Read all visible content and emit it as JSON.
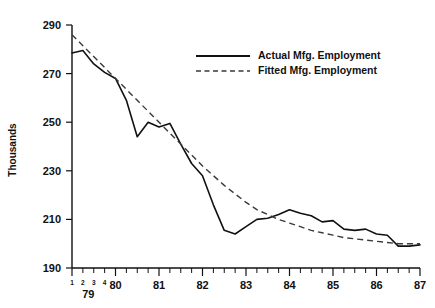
{
  "chart_data": {
    "type": "line",
    "title": "",
    "xlabel": "",
    "ylabel": "Thousands",
    "ylim": [
      190,
      290
    ],
    "ytick_values": [
      190,
      210,
      230,
      250,
      270,
      290
    ],
    "ytick_labels": [
      "190",
      "210",
      "230",
      "250",
      "270",
      "290"
    ],
    "grid": false,
    "legend_position": "top-center-right",
    "x_axis": {
      "year_labels": [
        "79",
        "80",
        "81",
        "82",
        "83",
        "84",
        "85",
        "86",
        "87"
      ],
      "quarter_labels": [
        "1",
        "2",
        "3",
        "4"
      ],
      "quarter_labels_year": "79",
      "tick_interval": "quarterly",
      "range_start": "1979 Q1",
      "range_end": "1987 Q1"
    },
    "x": [
      "79Q1",
      "79Q2",
      "79Q3",
      "79Q4",
      "80Q1",
      "80Q2",
      "80Q3",
      "80Q4",
      "81Q1",
      "81Q2",
      "81Q3",
      "81Q4",
      "82Q1",
      "82Q2",
      "82Q3",
      "82Q4",
      "83Q1",
      "83Q2",
      "83Q3",
      "83Q4",
      "84Q1",
      "84Q2",
      "84Q3",
      "84Q4",
      "85Q1",
      "85Q2",
      "85Q3",
      "85Q4",
      "86Q1",
      "86Q2",
      "86Q3",
      "86Q4",
      "87Q1"
    ],
    "series": [
      {
        "name": "Actual Mfg. Employment",
        "style": "solid",
        "color": "#111111",
        "values": [
          278.5,
          279.5,
          274.0,
          270.5,
          268.0,
          259.0,
          244.0,
          250.0,
          248.0,
          249.5,
          241.0,
          233.0,
          228.0,
          216.0,
          205.5,
          204.0,
          207.0,
          210.0,
          210.5,
          212.0,
          214.0,
          212.5,
          211.5,
          209.0,
          209.5,
          206.0,
          205.5,
          206.0,
          204.0,
          203.5,
          199.0,
          199.0,
          199.5
        ]
      },
      {
        "name": "Fitted Mfg. Employment",
        "style": "dashed",
        "color": "#3a3a3a",
        "values": [
          286.0,
          281.5,
          277.0,
          272.5,
          268.0,
          263.5,
          259.0,
          254.5,
          250.0,
          245.5,
          241.0,
          236.5,
          232.0,
          228.0,
          224.0,
          220.5,
          217.0,
          214.0,
          212.0,
          210.0,
          208.5,
          207.0,
          205.5,
          204.5,
          203.5,
          202.5,
          202.0,
          201.5,
          201.0,
          200.5,
          200.0,
          200.0,
          200.0
        ]
      }
    ],
    "legend": [
      {
        "label": "Actual Mfg. Employment",
        "style": "solid"
      },
      {
        "label": "Fitted Mfg. Employment",
        "style": "dashed"
      }
    ]
  }
}
